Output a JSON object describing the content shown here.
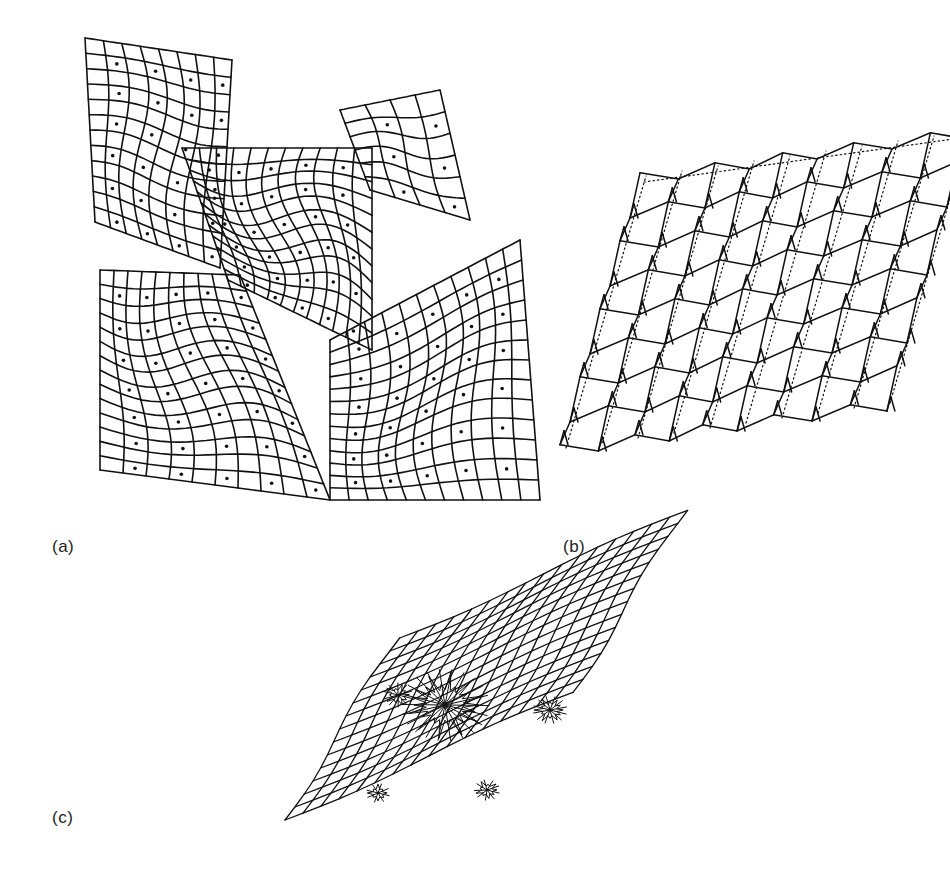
{
  "figure": {
    "panels": [
      {
        "id": "a",
        "label": "(a)",
        "description": "Four curved deformed mesh surfaces meeting at a central junction",
        "patches": [
          {
            "name": "upper-left",
            "corners": [
              [
                85,
                38
              ],
              [
                232,
                60
              ],
              [
                220,
                268
              ],
              [
                95,
                222
              ]
            ],
            "rows": 12,
            "cols": 8,
            "bulge": [
              18,
              -10
            ]
          },
          {
            "name": "upper-center",
            "corners": [
              [
                182,
                148
              ],
              [
                372,
                148
              ],
              [
                372,
                350
              ],
              [
                228,
                280
              ]
            ],
            "rows": 12,
            "cols": 11,
            "bulge": [
              -25,
              30
            ]
          },
          {
            "name": "upper-right-flap",
            "corners": [
              [
                340,
                110
              ],
              [
                440,
                90
              ],
              [
                470,
                220
              ],
              [
                370,
                190
              ]
            ],
            "rows": 6,
            "cols": 4,
            "bulge": [
              5,
              -10
            ]
          },
          {
            "name": "lower-left",
            "corners": [
              [
                100,
                270
              ],
              [
                240,
                275
              ],
              [
                330,
                500
              ],
              [
                100,
                470
              ]
            ],
            "rows": 14,
            "cols": 10,
            "bulge": [
              -20,
              25
            ]
          },
          {
            "name": "lower-right",
            "corners": [
              [
                330,
                340
              ],
              [
                520,
                240
              ],
              [
                540,
                500
              ],
              [
                330,
                500
              ]
            ],
            "rows": 13,
            "cols": 11,
            "bulge": [
              20,
              20
            ]
          }
        ]
      },
      {
        "id": "b",
        "label": "(b)",
        "description": "Sheared wireframe mesh with zig-zag vertical displacements and dotted reference lines",
        "grid": {
          "rows": 8,
          "cols": 9,
          "origin": [
            560,
            448
          ],
          "u": [
            36,
            -5
          ],
          "v": [
            10,
            -34
          ],
          "zigzag": 8
        }
      },
      {
        "id": "c",
        "label": "(c)",
        "description": "Sheared mesh with dark star-shaped clusters of concentrated distortion",
        "grid": {
          "rows": 14,
          "cols": 16,
          "origin": [
            285,
            820
          ],
          "u": [
            18,
            -8
          ],
          "v": [
            8,
            -13
          ]
        },
        "clusters": [
          {
            "cx": 445,
            "cy": 705,
            "r": 42,
            "spikes": 22
          },
          {
            "cx": 398,
            "cy": 695,
            "r": 14,
            "spikes": 10
          },
          {
            "cx": 550,
            "cy": 710,
            "r": 16,
            "spikes": 12
          },
          {
            "cx": 378,
            "cy": 793,
            "r": 11,
            "spikes": 8
          },
          {
            "cx": 487,
            "cy": 790,
            "r": 12,
            "spikes": 9
          }
        ]
      }
    ],
    "colors": {
      "ink": "#111111",
      "background": "#ffffff"
    }
  }
}
